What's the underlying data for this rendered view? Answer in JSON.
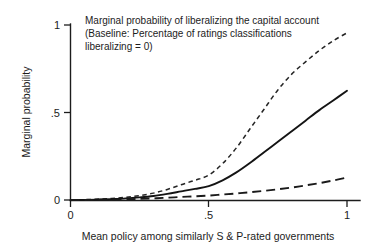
{
  "chart_data": {
    "type": "line",
    "title": "",
    "annotation": [
      "Marginal probability of liberalizing the capital account",
      "(Baseline: Percentage of ratings classifications",
      " liberalizing = 0)"
    ],
    "xlabel": "Mean policy among similarly S & P-rated governments",
    "ylabel": "Marginal probability",
    "xlim": [
      0,
      1
    ],
    "ylim": [
      0,
      1
    ],
    "xticks": [
      "0",
      ".5",
      "1"
    ],
    "xtickvalues": [
      0,
      0.5,
      1
    ],
    "yticks": [
      "0",
      ".5",
      "1"
    ],
    "ytickvalues": [
      0,
      0.5,
      1
    ],
    "grid": false,
    "legend": "none",
    "x": [
      0,
      0.05,
      0.1,
      0.15,
      0.2,
      0.25,
      0.3,
      0.35,
      0.4,
      0.45,
      0.5,
      0.55,
      0.6,
      0.65,
      0.7,
      0.75,
      0.8,
      0.85,
      0.9,
      0.95,
      1
    ],
    "series": [
      {
        "name": "upper-bound-short-dashed",
        "style": "short-dashed",
        "color": "#242424",
        "values": [
          0.003,
          0.005,
          0.008,
          0.012,
          0.018,
          0.028,
          0.042,
          0.063,
          0.09,
          0.115,
          0.145,
          0.21,
          0.3,
          0.41,
          0.52,
          0.63,
          0.72,
          0.79,
          0.855,
          0.91,
          0.955
        ]
      },
      {
        "name": "point-estimate-solid",
        "style": "solid",
        "color": "#141414",
        "values": [
          0.002,
          0.003,
          0.005,
          0.008,
          0.012,
          0.018,
          0.026,
          0.038,
          0.052,
          0.066,
          0.082,
          0.115,
          0.16,
          0.215,
          0.275,
          0.335,
          0.395,
          0.455,
          0.515,
          0.57,
          0.625
        ]
      },
      {
        "name": "lower-bound-long-dashed",
        "style": "long-dashed",
        "color": "#1a1a1a",
        "values": [
          0.002,
          0.003,
          0.004,
          0.005,
          0.007,
          0.009,
          0.012,
          0.016,
          0.02,
          0.024,
          0.028,
          0.034,
          0.04,
          0.047,
          0.055,
          0.064,
          0.074,
          0.086,
          0.099,
          0.114,
          0.131
        ]
      }
    ]
  }
}
